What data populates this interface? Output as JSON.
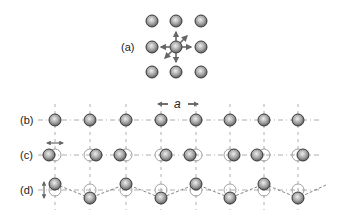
{
  "figure": {
    "panels": [
      {
        "id": "a",
        "label": "(a)",
        "description": "square lattice with central atom displacement arrows"
      },
      {
        "id": "b",
        "label": "(b)",
        "description": "undistorted 1D chain"
      },
      {
        "id": "c",
        "label": "(c)",
        "description": "longitudinal displacement (pairing)"
      },
      {
        "id": "d",
        "label": "(d)",
        "description": "transverse displacement (zigzag)"
      }
    ],
    "lattice_constant_label": "a",
    "colors": {
      "atom_fill_center": "#e6e6e6",
      "atom_fill_edge": "#6e6e6e",
      "atom_stroke": "#3a3a3a",
      "guide_line": "#9a9a9a",
      "arrow": "#666666"
    }
  }
}
